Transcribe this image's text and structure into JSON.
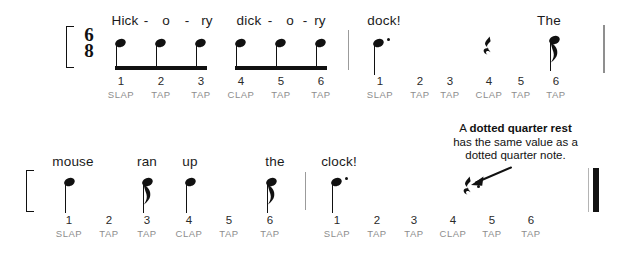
{
  "document": {
    "title": "Hickory Dickory Dock rhythm worksheet",
    "time_signature": {
      "top": "6",
      "bottom": "8"
    }
  },
  "colors": {
    "ink": "#111111",
    "beat_number": "#2a2a2a",
    "articulation": "#8d8d8d",
    "barline": "#9b9b9b"
  },
  "annotation": {
    "line1_prefix": "A ",
    "line1_bold": "dotted quarter rest",
    "line2": "has the same value as a",
    "line3": "dotted quarter note."
  },
  "systems": [
    {
      "id": "system-1",
      "lyrics": [
        {
          "text": "Hick",
          "x": 125
        },
        {
          "text": "o",
          "x": 166
        },
        {
          "text": "ry",
          "x": 207
        },
        {
          "text": "dick",
          "x": 249
        },
        {
          "text": "o",
          "x": 290
        },
        {
          "text": "ry",
          "x": 320
        },
        {
          "text": "dock!",
          "x": 384
        },
        {
          "text": "The",
          "x": 549
        }
      ],
      "hyphens": [
        {
          "text": "-",
          "x": 146
        },
        {
          "text": "-",
          "x": 187
        },
        {
          "text": "-",
          "x": 270
        },
        {
          "text": "-",
          "x": 305
        }
      ],
      "beats": [
        {
          "num": "1",
          "artic": "SLAP",
          "x": 121
        },
        {
          "num": "2",
          "artic": "TAP",
          "x": 161
        },
        {
          "num": "3",
          "artic": "TAP",
          "x": 201
        },
        {
          "num": "4",
          "artic": "CLAP",
          "x": 241
        },
        {
          "num": "5",
          "artic": "TAP",
          "x": 281
        },
        {
          "num": "6",
          "artic": "TAP",
          "x": 321
        },
        {
          "num": "1",
          "artic": "SLAP",
          "x": 380
        },
        {
          "num": "2",
          "artic": "TAP",
          "x": 420
        },
        {
          "num": "3",
          "artic": "TAP",
          "x": 450
        },
        {
          "num": "4",
          "artic": "CLAP",
          "x": 489
        },
        {
          "num": "5",
          "artic": "TAP",
          "x": 521
        },
        {
          "num": "6",
          "artic": "TAP",
          "x": 556
        }
      ]
    },
    {
      "id": "system-2",
      "lyrics": [
        {
          "text": "mouse",
          "x": 73
        },
        {
          "text": "ran",
          "x": 147
        },
        {
          "text": "up",
          "x": 190
        },
        {
          "text": "the",
          "x": 275
        },
        {
          "text": "clock!",
          "x": 339
        }
      ],
      "hyphens": [],
      "beats": [
        {
          "num": "1",
          "artic": "SLAP",
          "x": 69
        },
        {
          "num": "2",
          "artic": "TAP",
          "x": 109
        },
        {
          "num": "3",
          "artic": "TAP",
          "x": 147
        },
        {
          "num": "4",
          "artic": "CLAP",
          "x": 189
        },
        {
          "num": "5",
          "artic": "TAP",
          "x": 229
        },
        {
          "num": "6",
          "artic": "TAP",
          "x": 270
        },
        {
          "num": "1",
          "artic": "SLAP",
          "x": 337
        },
        {
          "num": "2",
          "artic": "TAP",
          "x": 377
        },
        {
          "num": "3",
          "artic": "TAP",
          "x": 414
        },
        {
          "num": "4",
          "artic": "CLAP",
          "x": 453
        },
        {
          "num": "5",
          "artic": "TAP",
          "x": 492
        },
        {
          "num": "6",
          "artic": "TAP",
          "x": 531
        }
      ]
    }
  ],
  "rhythm_data": {
    "meter": "6/8",
    "measures": [
      {
        "system": 1,
        "index": 1,
        "events": [
          {
            "type": "eighth-note",
            "beat": 1,
            "lyric": "Hick",
            "articulation": "SLAP",
            "beamed": true
          },
          {
            "type": "eighth-note",
            "beat": 2,
            "lyric": "o",
            "articulation": "TAP",
            "beamed": true
          },
          {
            "type": "eighth-note",
            "beat": 3,
            "lyric": "ry",
            "articulation": "TAP",
            "beamed": true
          },
          {
            "type": "eighth-note",
            "beat": 4,
            "lyric": "dick",
            "articulation": "CLAP",
            "beamed": true
          },
          {
            "type": "eighth-note",
            "beat": 5,
            "lyric": "o",
            "articulation": "TAP",
            "beamed": true
          },
          {
            "type": "eighth-note",
            "beat": 6,
            "lyric": "ry",
            "articulation": "TAP",
            "beamed": true
          }
        ]
      },
      {
        "system": 1,
        "index": 2,
        "events": [
          {
            "type": "dotted-quarter-note",
            "beat": 1,
            "lyric": "dock!",
            "articulation": "SLAP"
          },
          {
            "type": "quarter-rest",
            "beat": 4,
            "lyric": "",
            "articulation": "CLAP"
          },
          {
            "type": "eighth-note",
            "beat": 6,
            "lyric": "The",
            "articulation": "TAP"
          }
        ]
      },
      {
        "system": 2,
        "index": 3,
        "events": [
          {
            "type": "quarter-note",
            "beat": 1,
            "lyric": "mouse",
            "articulation": "SLAP"
          },
          {
            "type": "eighth-note",
            "beat": 3,
            "lyric": "ran",
            "articulation": "TAP"
          },
          {
            "type": "quarter-note",
            "beat": 4,
            "lyric": "up",
            "articulation": "CLAP"
          },
          {
            "type": "eighth-note",
            "beat": 6,
            "lyric": "the",
            "articulation": "TAP"
          }
        ]
      },
      {
        "system": 2,
        "index": 4,
        "events": [
          {
            "type": "dotted-quarter-note",
            "beat": 1,
            "lyric": "clock!",
            "articulation": "SLAP"
          },
          {
            "type": "dotted-quarter-rest",
            "beat": 4,
            "lyric": "",
            "articulation": "CLAP"
          }
        ]
      }
    ]
  }
}
